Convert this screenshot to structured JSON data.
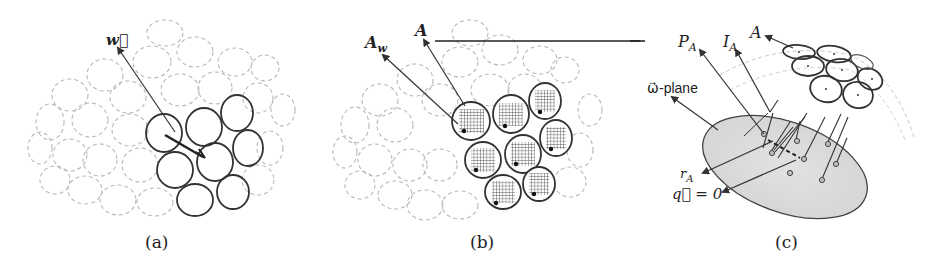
{
  "figure": {
    "panels": [
      {
        "id": "a",
        "caption": "(a)",
        "labels": {
          "w_vector": "w⃗"
        },
        "description": "Cloud of dashed ellipses with a highlighted cluster of 8 solid ellipses; arrow labeled w pointing up-left from cluster, bold short arrow inside cluster"
      },
      {
        "id": "b",
        "caption": "(b)",
        "labels": {
          "aw": "A",
          "aw_sub": "w",
          "a": "A"
        },
        "description": "Same cloud; 8 highlighted ellipses filled with grid hatching and a dark dot each; arrows labeled A_w and A"
      },
      {
        "id": "c",
        "caption": "(c)",
        "labels": {
          "pa": "P",
          "pa_sub": "A",
          "ia": "I",
          "ia_sub": "A",
          "a": "A",
          "omega_plane": "ω⃗-plane",
          "ra": "r",
          "ra_sub": "A",
          "q_zero": "q⃗ = 0"
        },
        "description": "Grey shaded ellipse (omega-plane) with projected points and lines; cluster of 8 solid ellipses above to the right on a dashed sphere"
      }
    ],
    "connector": "horizontal line from label A in (b) to panel (c)"
  }
}
